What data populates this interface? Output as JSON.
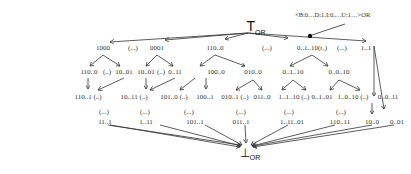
{
  "top": {
    "label": "T",
    "sub": "OR"
  },
  "bottom": {
    "label": "⊥",
    "sub": "OR"
  },
  "annotation": "<B:0…D:1.I:0,…U:1…>OR",
  "level1": [
    {
      "label": "1000",
      "x": 103
    },
    {
      "label": "(...)",
      "x": 133
    },
    {
      "label": "0001",
      "x": 157
    },
    {
      "label": "110..0",
      "x": 215
    },
    {
      "label": "(...)",
      "x": 267
    },
    {
      "label": "0..1..10(t₂)",
      "x": 312
    },
    {
      "label": "(...)",
      "x": 342
    },
    {
      "label": "1..1",
      "x": 366
    }
  ],
  "level2": [
    {
      "label": "110..0",
      "x": 89
    },
    {
      "label": "(..)",
      "x": 107
    },
    {
      "label": "10..01",
      "x": 124
    },
    {
      "label": "10..01",
      "x": 146
    },
    {
      "label": "(..)",
      "x": 161
    },
    {
      "label": "0..11",
      "x": 175
    },
    {
      "label": "100..0",
      "x": 216
    },
    {
      "label": "010..0",
      "x": 253
    },
    {
      "label": "0..1..10",
      "x": 293
    },
    {
      "label": "0..0..10",
      "x": 339
    }
  ],
  "level3": [
    {
      "label": "110..1 (..)",
      "x": 88
    },
    {
      "label": "10..11 (..)",
      "x": 134
    },
    {
      "label": "101..0 (..)",
      "x": 174
    },
    {
      "label": "100..1",
      "x": 205
    },
    {
      "label": "010..1 (..)",
      "x": 235
    },
    {
      "label": "011..0",
      "x": 262
    },
    {
      "label": "1..1..10 (..)",
      "x": 294
    },
    {
      "label": "0..1..01",
      "x": 322
    },
    {
      "label": "1..0..10 (..)",
      "x": 353
    },
    {
      "label": "0..0..11",
      "x": 388
    }
  ],
  "level4_dots": [
    {
      "label": "(...)",
      "x": 104
    },
    {
      "label": "(...)",
      "x": 145
    },
    {
      "label": "(...)",
      "x": 189
    },
    {
      "label": "(...)",
      "x": 241
    },
    {
      "label": "(...)",
      "x": 289
    },
    {
      "label": "(...)",
      "x": 341
    }
  ],
  "level4": [
    {
      "label": "11..1",
      "x": 105
    },
    {
      "label": "1..11",
      "x": 146
    },
    {
      "label": "101..1",
      "x": 195
    },
    {
      "label": "011..1",
      "x": 241
    },
    {
      "label": "1..11..01",
      "x": 292
    },
    {
      "label": "110..11",
      "x": 340
    },
    {
      "label": "10..0",
      "x": 372
    },
    {
      "label": "0..01",
      "x": 397
    }
  ]
}
